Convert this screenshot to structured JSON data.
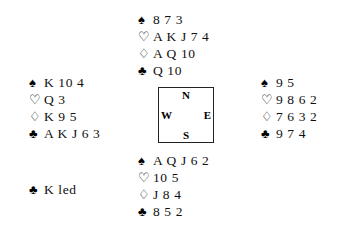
{
  "diagram": {
    "type": "bridge-hand-diagram",
    "background_color": "#ffffff",
    "text_color": "#111111",
    "suit_symbols": {
      "spade": "♠",
      "heart": "♡",
      "diamond": "♢",
      "club": "♣"
    },
    "compass": {
      "north": "N",
      "east": "E",
      "south": "S",
      "west": "W",
      "border_color": "#222222"
    },
    "hands": {
      "north": {
        "position_label": "North",
        "spades": "8 7 3",
        "hearts": "A K J 7 4",
        "diamonds": "A Q 10",
        "clubs": "Q 10"
      },
      "west": {
        "position_label": "West",
        "spades": "K 10 4",
        "hearts": "Q 3",
        "diamonds": "K 9 5",
        "clubs": "A K J 6 3"
      },
      "east": {
        "position_label": "East",
        "spades": "9 5",
        "hearts": "9 8 6 2",
        "diamonds": "7 6 3 2",
        "clubs": "9 7 4"
      },
      "south": {
        "position_label": "South",
        "spades": "A Q J 6 2",
        "hearts": "10 5",
        "diamonds": "J 8 4",
        "clubs": "8 5 2"
      }
    },
    "lead": {
      "suit": "♣",
      "text": "K led"
    }
  }
}
